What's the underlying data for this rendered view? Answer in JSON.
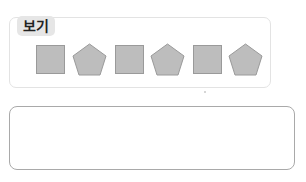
{
  "example": {
    "label": "보기",
    "shapes": [
      {
        "type": "square",
        "fill": "#bdbdbd"
      },
      {
        "type": "pentagon",
        "fill": "#bdbdbd"
      },
      {
        "type": "square",
        "fill": "#bdbdbd"
      },
      {
        "type": "pentagon",
        "fill": "#bdbdbd"
      },
      {
        "type": "square",
        "fill": "#bdbdbd"
      },
      {
        "type": "pentagon",
        "fill": "#bdbdbd"
      }
    ]
  },
  "answer": {
    "value": ""
  }
}
